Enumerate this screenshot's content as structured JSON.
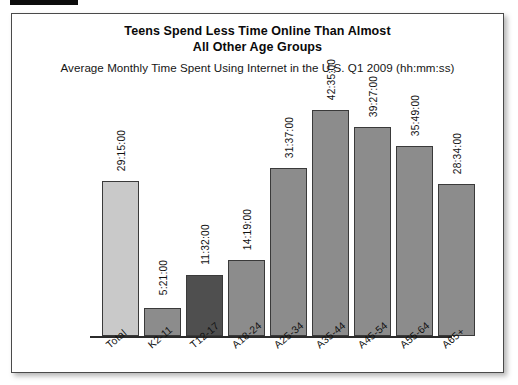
{
  "scan_artifact": {
    "name": "black-scan-bar"
  },
  "chart": {
    "title_line1": "Teens Spend Less Time Online Than Almost",
    "title_line2": "All Other Age Groups",
    "subtitle": "Average Monthly Time Spent Using Internet in the U.S. Q1 2009 (hh:mm:ss)"
  },
  "colors": {
    "bar_default": "#8c8c8c",
    "bar_total": "#c9c9c9",
    "bar_highlight": "#4f4f4f",
    "axis": "#2b2b2b",
    "text": "#111111",
    "frame_border": "#4a4a4a"
  },
  "chart_data": {
    "type": "bar",
    "title": "Teens Spend Less Time Online Than Almost All Other Age Groups",
    "subtitle": "Average Monthly Time Spent Using Internet in the U.S. Q1 2009 (hh:mm:ss)",
    "xlabel": "",
    "ylabel": "",
    "grid": false,
    "legend": false,
    "units": "hh:mm:ss",
    "ylim": [
      0,
      45
    ],
    "categories": [
      "Total",
      "K2-11",
      "T12-17",
      "A18-24",
      "A25-34",
      "A35-44",
      "A45-54",
      "A55-64",
      "A65+"
    ],
    "labels": [
      "29:15:00",
      "5:21:00",
      "11:32:00",
      "14:19:00",
      "31:37:00",
      "42:35:00",
      "39:27:00",
      "35:49:00",
      "28:34:00"
    ],
    "values": [
      29.25,
      5.35,
      11.533,
      14.317,
      31.617,
      42.583,
      39.45,
      35.817,
      28.567
    ],
    "bar_styles": [
      "total",
      "default",
      "highlight",
      "default",
      "default",
      "default",
      "default",
      "default",
      "default"
    ]
  }
}
